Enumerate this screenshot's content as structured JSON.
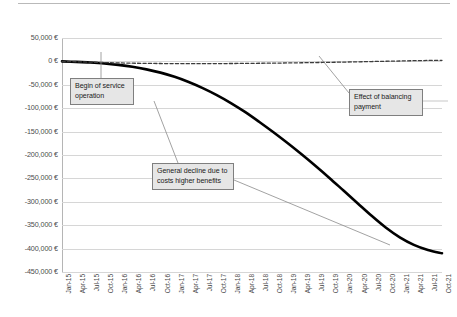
{
  "chart_data": {
    "type": "line",
    "title": "",
    "xlabel": "",
    "ylabel": "",
    "ylim": [
      -450000,
      50000
    ],
    "y_tick_labels": [
      "50,000 €",
      "0 €",
      "-50,000 €",
      "-100,000 €",
      "-150,000 €",
      "-200,000 €",
      "-250,000 €",
      "-300,000 €",
      "-350,000 €",
      "-400,000 €",
      "-450,000 €"
    ],
    "y_tick_values": [
      50000,
      0,
      -50000,
      -100000,
      -150000,
      -200000,
      -250000,
      -300000,
      -350000,
      -400000,
      -450000
    ],
    "grid": true,
    "legend": "none",
    "currency": "EUR",
    "categories": [
      "Jan-15",
      "Apr-15",
      "Jul-15",
      "Oct-15",
      "Jan-16",
      "Apr-16",
      "Jul-16",
      "Oct-16",
      "Jan-17",
      "Apr-17",
      "Jul-17",
      "Oct-17",
      "Jan-18",
      "Apr-18",
      "Jul-18",
      "Oct-18",
      "Jan-19",
      "Apr-19",
      "Jul-19",
      "Oct-19",
      "Jan-20",
      "Apr-20",
      "Jul-20",
      "Oct-20",
      "Jan-21",
      "Apr-21",
      "Jul-21",
      "Oct-21"
    ],
    "series": [
      {
        "name": "Cumulative result without balancing payment",
        "style": "solid",
        "color": "#000000",
        "width": 2.6,
        "values": [
          0,
          -1000,
          -2500,
          -4500,
          -7500,
          -11500,
          -17000,
          -24000,
          -33000,
          -44000,
          -57000,
          -72000,
          -89000,
          -108000,
          -129000,
          -151000,
          -174000,
          -198000,
          -223000,
          -249000,
          -276000,
          -303000,
          -330000,
          -355000,
          -376000,
          -392000,
          -403000,
          -410000
        ]
      },
      {
        "name": "Cumulative result with balancing payment",
        "style": "dashed",
        "color": "#3c3c3c",
        "width": 1.3,
        "values": [
          0,
          -800,
          -1600,
          -2400,
          -3200,
          -3800,
          -4200,
          -4500,
          -4700,
          -4800,
          -4800,
          -4700,
          -4500,
          -4300,
          -4000,
          -3700,
          -3300,
          -2900,
          -2500,
          -2000,
          -1500,
          -900,
          -300,
          300,
          900,
          1500,
          2000,
          2400
        ]
      }
    ],
    "annotations": [
      {
        "id": "begin-of-service-operation",
        "text": "Begin of service operation",
        "points_to": "Jul-15"
      },
      {
        "id": "general-decline",
        "text": "General decline due to costs higher benefits",
        "points_to": "Apr-21"
      },
      {
        "id": "effect-of-balancing-payment",
        "text": "Effect of balancing payment",
        "points_to": "Jan-20"
      }
    ]
  }
}
